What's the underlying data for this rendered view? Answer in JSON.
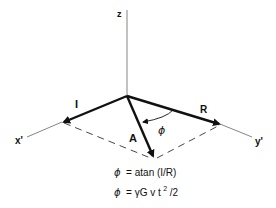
{
  "diagram": {
    "axes": {
      "z": {
        "label": "z"
      },
      "x": {
        "label": "x'"
      },
      "y": {
        "label": "y'"
      }
    },
    "vectors": {
      "I": {
        "label": "I"
      },
      "R": {
        "label": "R"
      },
      "A": {
        "label": "A"
      }
    },
    "angle": {
      "label": "ϕ"
    },
    "equations": [
      {
        "lhs": "ϕ",
        "rhs": "= atan (I/R)"
      },
      {
        "lhs": "ϕ",
        "rhs_main": "= γG v t",
        "rhs_sup": "2",
        "rhs_tail": "/2"
      }
    ],
    "colors": {
      "ink": "#111111",
      "axis": "#555555",
      "background": "#ffffff"
    }
  }
}
